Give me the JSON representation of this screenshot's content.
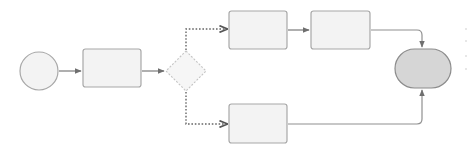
{
  "diagram": {
    "type": "flowchart",
    "colors": {
      "background": "#ffffff",
      "node_fill": "#f3f3f3",
      "node_stroke": "#a8a8a8",
      "terminal_end_fill": "#d6d6d6",
      "terminal_end_stroke": "#8c8c8c",
      "decision_stroke": "#c4c4c4",
      "edge_solid": "#7a7a7a",
      "edge_dotted": "#666666",
      "edge_merge": "#909090"
    },
    "nodes": [
      {
        "id": "start",
        "shape": "circle",
        "label": "",
        "cx": 39,
        "cy": 71,
        "r": 19
      },
      {
        "id": "step1",
        "shape": "rounded-rect",
        "label": "",
        "x": 83,
        "y": 49,
        "w": 58,
        "h": 38
      },
      {
        "id": "decision",
        "shape": "diamond",
        "label": "",
        "cx": 186,
        "cy": 71,
        "half": 20
      },
      {
        "id": "step2",
        "shape": "rounded-rect",
        "label": "",
        "x": 229,
        "y": 11,
        "w": 58,
        "h": 38
      },
      {
        "id": "step3",
        "shape": "rounded-rect",
        "label": "",
        "x": 311,
        "y": 11,
        "w": 59,
        "h": 38
      },
      {
        "id": "step4",
        "shape": "rounded-rect",
        "label": "",
        "x": 229,
        "y": 104,
        "w": 58,
        "h": 39
      },
      {
        "id": "end",
        "shape": "stadium",
        "label": "",
        "x": 395,
        "y": 49,
        "w": 56,
        "h": 39
      }
    ],
    "edges": [
      {
        "from": "start",
        "to": "step1",
        "style": "solid"
      },
      {
        "from": "step1",
        "to": "decision",
        "style": "solid"
      },
      {
        "from": "decision",
        "to": "step2",
        "style": "dotted",
        "branch": "top"
      },
      {
        "from": "decision",
        "to": "step4",
        "style": "dotted",
        "branch": "bottom"
      },
      {
        "from": "step2",
        "to": "step3",
        "style": "solid"
      },
      {
        "from": "step3",
        "to": "end",
        "style": "solid"
      },
      {
        "from": "step4",
        "to": "end",
        "style": "solid"
      }
    ]
  }
}
